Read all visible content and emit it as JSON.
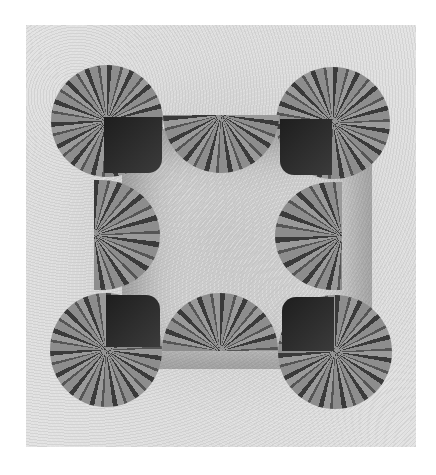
{
  "image": {
    "description": "Black-and-white photograph of watermelon halves and cut melons arranged in a square frame on a textured light surface",
    "alt": "Watermelons arranged in a square",
    "colors": {
      "background": "#ffffff",
      "surface": "#d6d6d6",
      "rind_dark": "#3a3a3a",
      "rind_light": "#9a9a9a",
      "cut_shadow": "#1e1e1e"
    },
    "pieces": [
      {
        "id": "top-left",
        "type": "quarter-cut-whole"
      },
      {
        "id": "top-middle",
        "type": "half"
      },
      {
        "id": "top-right",
        "type": "quarter-cut-whole"
      },
      {
        "id": "left-middle",
        "type": "half"
      },
      {
        "id": "right-middle",
        "type": "half"
      },
      {
        "id": "bottom-left",
        "type": "quarter-cut-whole"
      },
      {
        "id": "bottom-middle",
        "type": "half"
      },
      {
        "id": "bottom-right",
        "type": "quarter-cut-whole"
      }
    ]
  }
}
